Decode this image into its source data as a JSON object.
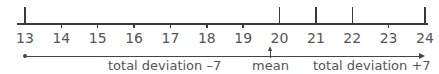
{
  "number_line": {
    "min": 13,
    "max": 24,
    "ticks": [
      13,
      14,
      15,
      16,
      17,
      18,
      19,
      20,
      21,
      22,
      23,
      24
    ],
    "labels": [
      "13",
      "14",
      "15",
      "16",
      "17",
      "18",
      "19",
      "20",
      "21",
      "22",
      "23",
      "24"
    ],
    "data_points": [
      13,
      20,
      21,
      22,
      24
    ],
    "mean": 20
  },
  "annotations": {
    "left_deviation": "total deviation –7",
    "mean_label": "mean",
    "right_deviation": "total deviation +7"
  },
  "colors": {
    "line": "#3a3a3a",
    "text": "#555555"
  }
}
